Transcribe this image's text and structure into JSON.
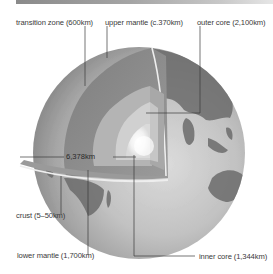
{
  "diagram": {
    "title": "",
    "type": "earth-cross-section",
    "labels": {
      "transition_zone": "transition zone (600km)",
      "upper_mantle": "upper mantle (c.370km)",
      "outer_core": "outer core (2,100km)",
      "crust": "crust (5–50km)",
      "lower_mantle": "lower mantle (1,700km)",
      "inner_core": "inner core (1,344km)",
      "radius": "6,378km"
    },
    "colors": {
      "background": "#ffffff",
      "leader_line": "#3a3a3a",
      "text": "#3a3a3a",
      "globe_ocean": "#b8b8b8",
      "globe_land": "#6e6e6e",
      "mantle_cut": "#8c8c8c",
      "lower_mantle_cut": "#bdbdbd",
      "outer_core_cut": "#d4d4d4",
      "inner_core_cut": "#f4f4f4"
    }
  }
}
